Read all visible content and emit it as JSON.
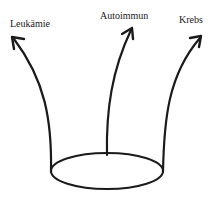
{
  "diagram": {
    "type": "branching-arrows",
    "base_shape": "ellipse",
    "stroke_color": "#1a1a1a",
    "background": "#ffffff",
    "labels": {
      "left": "Leukämie",
      "center": "Autoimmun",
      "right": "Krebs"
    },
    "branches": [
      {
        "id": "left",
        "target": "Leukämie"
      },
      {
        "id": "center",
        "target": "Autoimmun"
      },
      {
        "id": "right",
        "target": "Krebs"
      }
    ]
  }
}
